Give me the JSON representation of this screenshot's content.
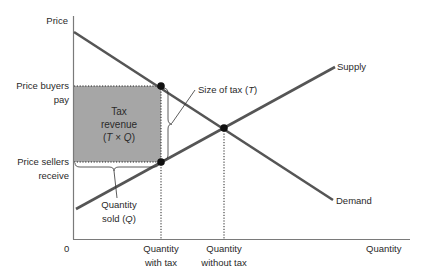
{
  "diagram": {
    "axes": {
      "y_label": "Price",
      "x_label": "Quantity",
      "origin_label": "0"
    },
    "price_labels": {
      "buyers_line1": "Price buyers",
      "buyers_line2": "pay",
      "sellers_line1": "Price sellers",
      "sellers_line2": "receive"
    },
    "quantity_labels": {
      "with_tax_line1": "Quantity",
      "with_tax_line2": "with tax",
      "without_tax_line1": "Quantity",
      "without_tax_line2": "without tax"
    },
    "curves": {
      "supply": "Supply",
      "demand": "Demand"
    },
    "annotations": {
      "tax_revenue_line1": "Tax",
      "tax_revenue_line2": "revenue",
      "tax_revenue_line3_pre": "(",
      "tax_revenue_T": "T",
      "tax_revenue_times": " × ",
      "tax_revenue_Q": "Q",
      "tax_revenue_line3_post": ")",
      "size_of_tax_pre": "Size of tax (",
      "size_of_tax_T": "T",
      "size_of_tax_post": ")",
      "quantity_sold_line1": "Quantity",
      "quantity_sold_line2_pre": "sold (",
      "quantity_sold_Q": "Q",
      "quantity_sold_line2_post": ")"
    },
    "colors": {
      "curve": "#555555",
      "shaded": "#a6a6a6",
      "axis": "#7a7a7a",
      "dot": "#111111"
    }
  }
}
